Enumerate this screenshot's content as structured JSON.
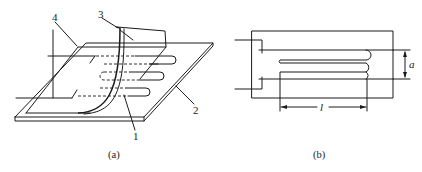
{
  "figure": {
    "panel_a": {
      "caption": "(a)",
      "callouts": [
        {
          "id": "1",
          "label": "1"
        },
        {
          "id": "2",
          "label": "2"
        },
        {
          "id": "3",
          "label": "3"
        },
        {
          "id": "4",
          "label": "4"
        }
      ]
    },
    "panel_b": {
      "caption": "(b)",
      "dimensions": {
        "width_label": "a",
        "length_label": "l"
      }
    }
  }
}
